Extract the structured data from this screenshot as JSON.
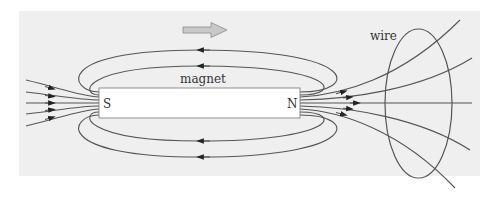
{
  "diagram": {
    "type": "physics-illustration",
    "labels": {
      "magnet": "magnet",
      "south_pole": "S",
      "north_pole": "N",
      "wire": "wire"
    },
    "motion_arrow": {
      "direction": "right",
      "meaning": "magnet motion"
    },
    "colors": {
      "panel_background": "#efefef",
      "magnet_fill": "#ffffff",
      "line_color": "#555555",
      "arrow_fill": "#c8c8c8",
      "arrow_stroke": "#8a8a8a"
    },
    "field_lines": {
      "upper_loops": 2,
      "lower_loops": 2,
      "entering_south": 5,
      "exiting_north": 5
    }
  }
}
